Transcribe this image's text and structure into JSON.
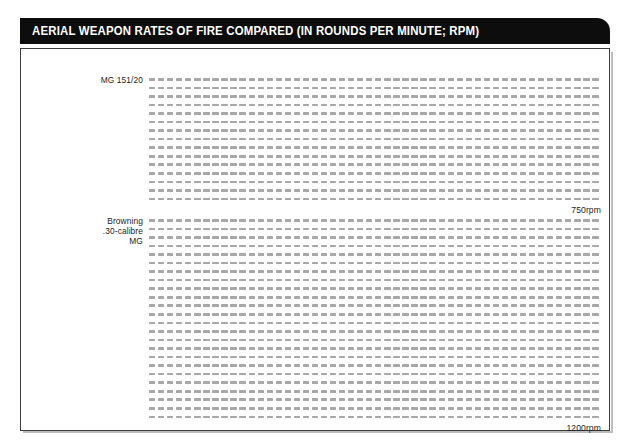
{
  "title": "AERIAL WEAPON RATES OF FIRE COMPARED (IN ROUNDS PER MINUTE; RPM)",
  "chart_data": {
    "type": "bar",
    "title": "AERIAL WEAPON RATES OF FIRE COMPARED (IN ROUNDS PER MINUTE; RPM)",
    "subtitle": "",
    "xlabel": "",
    "ylabel": "",
    "unit": "rpm",
    "glyph": "one dash = one round fired per minute",
    "rounds_per_row": 50,
    "categories": [
      "MG 151/20",
      "Browning .30-calibre MG"
    ],
    "values": [
      750,
      1200
    ],
    "value_labels": [
      "750rpm",
      "1200rpm"
    ],
    "series": [
      {
        "name": "Rate of fire",
        "values": [
          750,
          1200
        ]
      }
    ],
    "items": [
      {
        "name": "MG 151/20",
        "label_lines": [
          "MG 151/20"
        ],
        "value": 750,
        "value_label": "750rpm",
        "rows": 15,
        "per_row": 50
      },
      {
        "name": "Browning .30-calibre MG",
        "label_lines": [
          "Browning",
          ".30-calibre",
          "MG"
        ],
        "value": 1200,
        "value_label": "1200rpm",
        "rows": 24,
        "per_row": 50
      }
    ],
    "grid": false,
    "legend": "none"
  },
  "colors": {
    "titlebar_background": "#0d0d0d",
    "titlebar_text": "#ffffff",
    "round_mark": "#a8a8a8",
    "frame_border": "#3c3c3c",
    "label_text": "#1c1c1c",
    "page_background": "#ffffff"
  }
}
